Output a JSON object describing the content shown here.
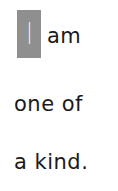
{
  "text": {
    "highlight_letter": "I",
    "line1": "am",
    "line2": "one  of",
    "line3": "a  kind."
  },
  "colors": {
    "highlight_box": "#8f8f8f",
    "text": "#1a1a1a",
    "background": "#ffffff"
  }
}
